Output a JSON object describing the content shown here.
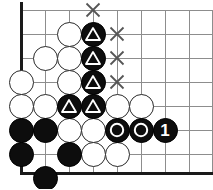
{
  "diagram": {
    "kind": "go-board-problem-diagram",
    "board": {
      "origin_x": 21,
      "origin_y": 10,
      "spacing": 24,
      "cols": 9,
      "rows": 8,
      "stone_radius": 12.5,
      "grid_color": "#8d8d8d",
      "edge_color": "#1a1a1a",
      "background": "#ffffff",
      "left_edge_x": 21,
      "bottom_edge_y": 173
    },
    "colors": {
      "black_stone": "#0d0d0d",
      "white_stone": "#ffffff",
      "stone_outline": "#2a2a2a",
      "mark_white": "#ffffff",
      "mark_x": "#555555",
      "number_text": "#ffffff"
    },
    "stones": [
      {
        "id": "w1",
        "color": "white",
        "col": 2,
        "row": 1,
        "x": 69,
        "y": 34,
        "mark": "none"
      },
      {
        "id": "b1",
        "color": "black",
        "col": 3,
        "row": 1,
        "x": 93,
        "y": 34,
        "mark": "triangle"
      },
      {
        "id": "w2",
        "color": "white",
        "col": 1,
        "row": 2,
        "x": 45,
        "y": 58,
        "mark": "none"
      },
      {
        "id": "w3",
        "color": "white",
        "col": 2,
        "row": 2,
        "x": 69,
        "y": 58,
        "mark": "none"
      },
      {
        "id": "b2",
        "color": "black",
        "col": 3,
        "row": 2,
        "x": 93,
        "y": 58,
        "mark": "triangle"
      },
      {
        "id": "w4",
        "color": "white",
        "col": 0,
        "row": 3,
        "x": 21,
        "y": 82,
        "mark": "none"
      },
      {
        "id": "w5",
        "color": "white",
        "col": 2,
        "row": 3,
        "x": 69,
        "y": 82,
        "mark": "none"
      },
      {
        "id": "b3",
        "color": "black",
        "col": 3,
        "row": 3,
        "x": 93,
        "y": 82,
        "mark": "triangle"
      },
      {
        "id": "w6",
        "color": "white",
        "col": 0,
        "row": 4,
        "x": 21,
        "y": 106,
        "mark": "none"
      },
      {
        "id": "w7",
        "color": "white",
        "col": 1,
        "row": 4,
        "x": 45,
        "y": 106,
        "mark": "none"
      },
      {
        "id": "b4",
        "color": "black",
        "col": 2,
        "row": 4,
        "x": 69,
        "y": 106,
        "mark": "triangle"
      },
      {
        "id": "b5",
        "color": "black",
        "col": 3,
        "row": 4,
        "x": 93,
        "y": 106,
        "mark": "triangle"
      },
      {
        "id": "w8",
        "color": "white",
        "col": 4,
        "row": 4,
        "x": 117,
        "y": 106,
        "mark": "none"
      },
      {
        "id": "w9",
        "color": "white",
        "col": 5,
        "row": 4,
        "x": 141,
        "y": 106,
        "mark": "none"
      },
      {
        "id": "b6",
        "color": "black",
        "col": 0,
        "row": 5,
        "x": 21,
        "y": 130,
        "mark": "none"
      },
      {
        "id": "b7",
        "color": "black",
        "col": 1,
        "row": 5,
        "x": 45,
        "y": 130,
        "mark": "none"
      },
      {
        "id": "w10",
        "color": "white",
        "col": 2,
        "row": 5,
        "x": 69,
        "y": 130,
        "mark": "none"
      },
      {
        "id": "w11",
        "color": "white",
        "col": 3,
        "row": 5,
        "x": 93,
        "y": 130,
        "mark": "none"
      },
      {
        "id": "b8",
        "color": "black",
        "col": 4,
        "row": 5,
        "x": 117,
        "y": 130,
        "mark": "circle"
      },
      {
        "id": "b9",
        "color": "black",
        "col": 5,
        "row": 5,
        "x": 141,
        "y": 130,
        "mark": "circle"
      },
      {
        "id": "b10",
        "color": "black",
        "col": 6,
        "row": 5,
        "x": 165,
        "y": 130,
        "mark": "number",
        "label": "1"
      },
      {
        "id": "b11",
        "color": "black",
        "col": 0,
        "row": 6,
        "x": 21,
        "y": 154,
        "mark": "none"
      },
      {
        "id": "b12",
        "color": "black",
        "col": 2,
        "row": 6,
        "x": 69,
        "y": 154,
        "mark": "none"
      },
      {
        "id": "w12",
        "color": "white",
        "col": 3,
        "row": 6,
        "x": 93,
        "y": 154,
        "mark": "none"
      },
      {
        "id": "w13",
        "color": "white",
        "col": 4,
        "row": 6,
        "x": 117,
        "y": 154,
        "mark": "none"
      },
      {
        "id": "b13",
        "color": "black",
        "col": 1,
        "row": 7,
        "x": 45,
        "y": 178,
        "mark": "none"
      }
    ],
    "x_marks": [
      {
        "id": "x1",
        "x": 93,
        "y": 10,
        "label": "X"
      },
      {
        "id": "x2",
        "x": 117,
        "y": 34,
        "label": "X"
      },
      {
        "id": "x3",
        "x": 117,
        "y": 58,
        "label": "X"
      },
      {
        "id": "x4",
        "x": 117,
        "y": 82,
        "label": "X"
      }
    ],
    "grid_lines": {
      "horizontal_y": [
        10,
        34,
        58,
        82,
        106,
        130,
        154
      ],
      "vertical_x": [
        45,
        69,
        93,
        117,
        141,
        165,
        189,
        212
      ]
    },
    "legend": {
      "triangle_meaning": "marked black stones",
      "circle_meaning": "marked black stones",
      "x_meaning": "key points",
      "number_meaning": "move order"
    }
  }
}
